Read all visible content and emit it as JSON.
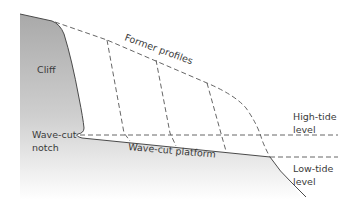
{
  "diagram": {
    "labels": {
      "cliff": "Cliff",
      "former_profiles": "Former profiles",
      "notch_line1": "Wave-cut",
      "notch_line2": "notch",
      "platform": "Wave-cut platform",
      "high_tide_line1": "High-tide",
      "high_tide_line2": "level",
      "low_tide_line1": "Low-tide",
      "low_tide_line2": "level"
    },
    "colors": {
      "rock_fill": "#a6a6a6",
      "rock_fill_light": "#ffffff",
      "outline": "#4a4a4a",
      "dashed": "#555555",
      "text": "#3a3a3a"
    }
  }
}
